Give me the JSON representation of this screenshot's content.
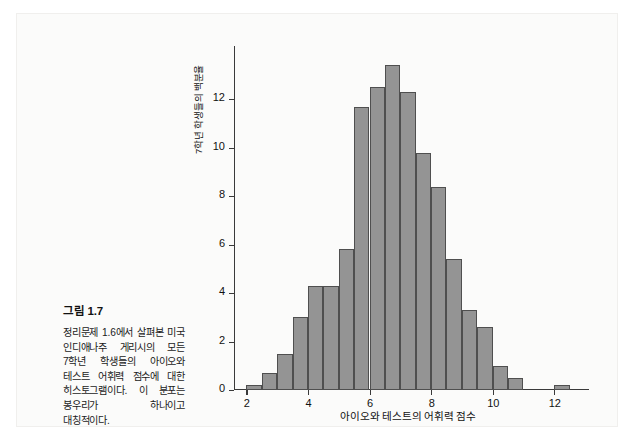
{
  "figure": {
    "caption_title": "그림 1.7",
    "caption_body": "정리문제 1.6에서 살펴본 미국 인디애나주 게리시의 모든 7학년 학생들의 아이오와 테스트 어휘력 점수에 대한 히스토그램이다. 이 분포는 봉우리가 하나이고 대칭적이다."
  },
  "chart_data": {
    "type": "bar",
    "title": "",
    "subtitle": "",
    "xlabel": "아이오와 테스트의 어휘력 점수",
    "ylabel": "7학년 학생들의 백분율",
    "xlim": [
      1.6,
      12.9
    ],
    "ylim": [
      0,
      14.2
    ],
    "grid": false,
    "legend": null,
    "bin_width": 0.5,
    "xtick_labels": [
      "2",
      "4",
      "6",
      "8",
      "10",
      "12"
    ],
    "xticks": [
      2,
      4,
      6,
      8,
      10,
      12
    ],
    "ytick_labels": [
      "0",
      "2",
      "4",
      "6",
      "8",
      "10",
      "12"
    ],
    "yticks": [
      0,
      2,
      4,
      6,
      8,
      10,
      12
    ],
    "bars": [
      {
        "bin_start": 2.0,
        "bin_end": 2.5,
        "value": 0.2
      },
      {
        "bin_start": 2.5,
        "bin_end": 3.0,
        "value": 0.7
      },
      {
        "bin_start": 3.0,
        "bin_end": 3.5,
        "value": 1.5
      },
      {
        "bin_start": 3.5,
        "bin_end": 4.0,
        "value": 3.0
      },
      {
        "bin_start": 4.0,
        "bin_end": 4.5,
        "value": 4.3
      },
      {
        "bin_start": 4.5,
        "bin_end": 5.0,
        "value": 4.3
      },
      {
        "bin_start": 5.0,
        "bin_end": 5.5,
        "value": 5.8
      },
      {
        "bin_start": 5.5,
        "bin_end": 6.0,
        "value": 11.7
      },
      {
        "bin_start": 6.0,
        "bin_end": 6.5,
        "value": 12.5
      },
      {
        "bin_start": 6.5,
        "bin_end": 7.0,
        "value": 13.4
      },
      {
        "bin_start": 7.0,
        "bin_end": 7.5,
        "value": 12.3
      },
      {
        "bin_start": 7.5,
        "bin_end": 8.0,
        "value": 9.8
      },
      {
        "bin_start": 8.0,
        "bin_end": 8.5,
        "value": 8.4
      },
      {
        "bin_start": 8.5,
        "bin_end": 9.0,
        "value": 5.4
      },
      {
        "bin_start": 9.0,
        "bin_end": 9.5,
        "value": 3.3
      },
      {
        "bin_start": 9.5,
        "bin_end": 10.0,
        "value": 2.6
      },
      {
        "bin_start": 10.0,
        "bin_end": 10.5,
        "value": 1.0
      },
      {
        "bin_start": 10.5,
        "bin_end": 11.0,
        "value": 0.5
      },
      {
        "bin_start": 12.0,
        "bin_end": 12.5,
        "value": 0.2
      }
    ],
    "colors": {
      "bar_fill": "#949494",
      "bar_border": "#4f4f4f",
      "axis": "#3a3a3a",
      "text": "#111111",
      "page_background": "#fbfbfa"
    }
  }
}
